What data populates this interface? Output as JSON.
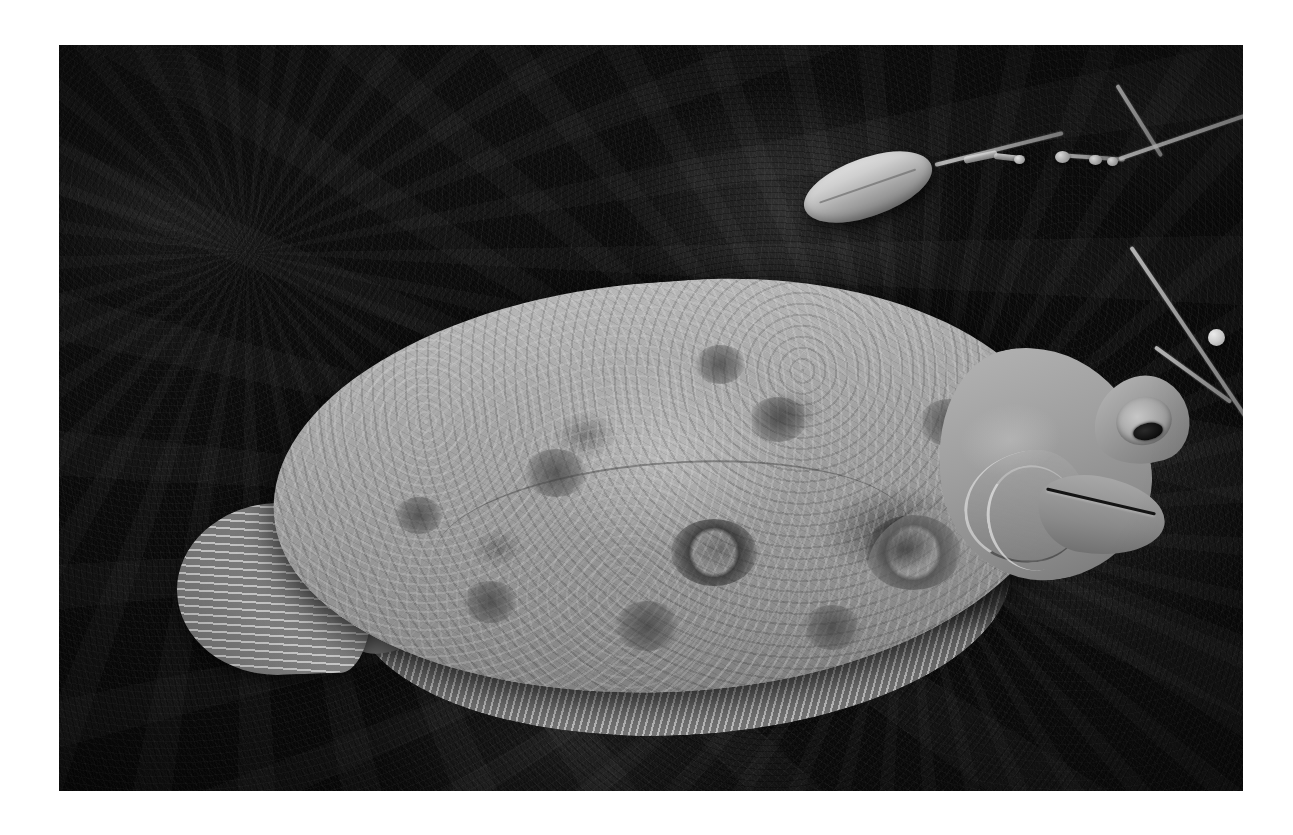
{
  "photo": {
    "subject": "flounder",
    "palette": {
      "paper": "#ffffff",
      "ground_dark": "#0b0b0b",
      "fish_light": "#b9b9b9",
      "fish_mid": "#9a9a9a",
      "fish_dark": "#7e7e7e",
      "sinker_highlight": "#e3e3e3",
      "line_gray": "#d7d7d7"
    },
    "frame": {
      "left": 59,
      "top": 45,
      "width": 1184,
      "height": 746
    }
  },
  "subjects": {
    "fish": {
      "name": "flounder",
      "parts": {
        "body": "body",
        "head": "head",
        "snout": "snout",
        "eye": "eye",
        "pupil": "pupil",
        "jaw": "jaw",
        "mouth": "mouth",
        "gill_cover": "gill-cover",
        "operculum": "operculum-edge",
        "pectoral_fin": "pectoral-fin",
        "dorsal_fin": "dorsal-fin",
        "anal_fin": "anal-fin",
        "caudal_fin": "caudal-fin",
        "caudal_peduncle": "caudal-peduncle",
        "lateral_line": "lateral-line"
      },
      "spots": [
        {
          "left": 612,
          "top": 474,
          "size": 86,
          "ring": true
        },
        {
          "left": 806,
          "top": 470,
          "size": 96,
          "ring": true
        },
        {
          "left": 466,
          "top": 404,
          "size": 62,
          "ring": false
        },
        {
          "left": 690,
          "top": 352,
          "size": 58,
          "ring": false
        },
        {
          "left": 556,
          "top": 556,
          "size": 64,
          "ring": false
        },
        {
          "left": 404,
          "top": 536,
          "size": 54,
          "ring": false
        },
        {
          "left": 744,
          "top": 560,
          "size": 58,
          "ring": false
        },
        {
          "left": 860,
          "top": 354,
          "size": 60,
          "ring": false
        },
        {
          "left": 336,
          "top": 452,
          "size": 48,
          "ring": false
        },
        {
          "left": 636,
          "top": 300,
          "size": 50,
          "ring": false
        }
      ]
    },
    "rig": {
      "name": "fishing-rig",
      "parts": {
        "sinker": "torpedo-sinker",
        "swivel": "barrel-swivel",
        "bead": "white-bead",
        "line": "fishing-line",
        "clip": "snap-clip"
      },
      "lines": [
        {
          "left": 876,
          "top": 118,
          "width": 132,
          "height": 4,
          "rotate": -14
        },
        {
          "left": 1000,
          "top": 108,
          "width": 66,
          "height": 4,
          "rotate": 4
        },
        {
          "left": 1058,
          "top": 38,
          "width": 84,
          "height": 4,
          "rotate": 58
        },
        {
          "left": 1060,
          "top": 112,
          "width": 216,
          "height": 4,
          "rotate": -19
        },
        {
          "left": 1072,
          "top": 200,
          "width": 210,
          "height": 4,
          "rotate": 56
        },
        {
          "left": 1096,
          "top": 300,
          "width": 94,
          "height": 4,
          "rotate": 36
        }
      ],
      "swivels": [
        {
          "left": 996,
          "top": 106,
          "size": 15
        },
        {
          "left": 1030,
          "top": 110,
          "size": 13
        },
        {
          "left": 1048,
          "top": 112,
          "size": 11
        },
        {
          "left": 955,
          "top": 110,
          "size": 11
        }
      ],
      "clips": [
        {
          "left": 905,
          "top": 112,
          "width": 34,
          "height": 7,
          "rotate": -12
        },
        {
          "left": 935,
          "top": 108,
          "width": 26,
          "height": 6,
          "rotate": 6
        }
      ]
    }
  }
}
